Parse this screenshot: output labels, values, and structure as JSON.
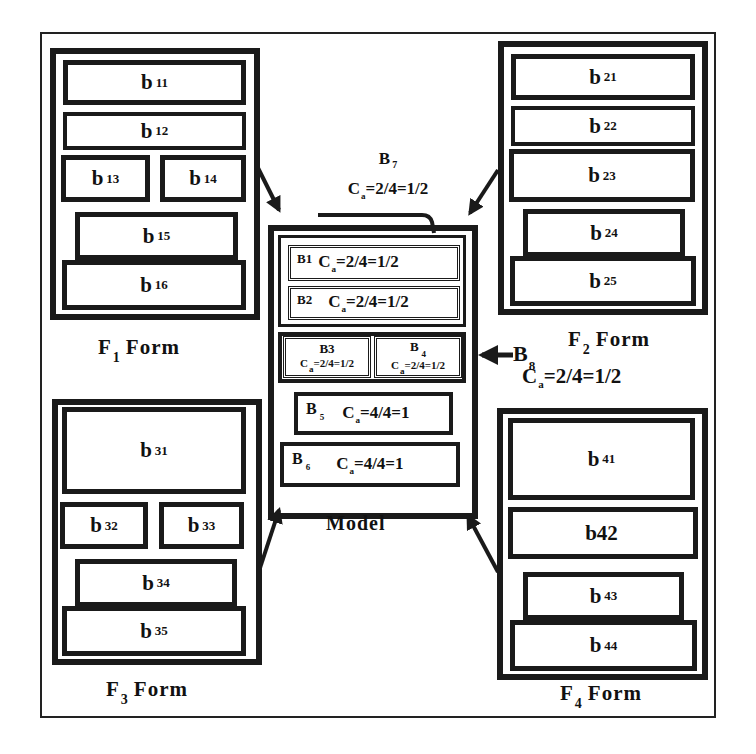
{
  "diagram": {
    "forms": [
      {
        "id": "F1",
        "label_main": "F",
        "label_sub": "1",
        "label_tail": "Form",
        "blocks": [
          {
            "main": "b",
            "sub": "11"
          },
          {
            "main": "b",
            "sub": "12"
          },
          {
            "main": "b",
            "sub": "13"
          },
          {
            "main": "b",
            "sub": "14"
          },
          {
            "main": "b",
            "sub": "15"
          },
          {
            "main": "b",
            "sub": "16"
          }
        ]
      },
      {
        "id": "F2",
        "label_main": "F",
        "label_sub": "2",
        "label_tail": "Form",
        "blocks": [
          {
            "main": "b",
            "sub": "21"
          },
          {
            "main": "b",
            "sub": "22"
          },
          {
            "main": "b",
            "sub": "23"
          },
          {
            "main": "b",
            "sub": "24"
          },
          {
            "main": "b",
            "sub": "25"
          }
        ]
      },
      {
        "id": "F3",
        "label_main": "F",
        "label_sub": "3",
        "label_tail": "Form",
        "blocks": [
          {
            "main": "b",
            "sub": "31"
          },
          {
            "main": "b",
            "sub": "32"
          },
          {
            "main": "b",
            "sub": "33"
          },
          {
            "main": "b",
            "sub": "34"
          },
          {
            "main": "b",
            "sub": "35"
          }
        ]
      },
      {
        "id": "F4",
        "label_main": "F",
        "label_sub": "4",
        "label_tail": "Form",
        "blocks": [
          {
            "main": "b",
            "sub": "41"
          },
          {
            "main": "b42",
            "sub": ""
          },
          {
            "main": "b",
            "sub": "43"
          },
          {
            "main": "b",
            "sub": "44"
          }
        ]
      }
    ],
    "model": {
      "label": "Model",
      "blocks": [
        {
          "tag": "B1",
          "ca_prefix": "C",
          "ca_sub": "a",
          "ca_value": "=2/4=1/2"
        },
        {
          "tag": "B2",
          "ca_prefix": "C",
          "ca_sub": "a",
          "ca_value": "=2/4=1/2"
        },
        {
          "tag": "B3",
          "ca_prefix": "C",
          "ca_sub": "a",
          "ca_value": "=2/4=1/2"
        },
        {
          "tag_main": "B",
          "tag_sub": "4",
          "ca_prefix": "C",
          "ca_sub": "a",
          "ca_value": "=2/4=1/2"
        },
        {
          "tag_main": "B",
          "tag_sub": "5",
          "ca_prefix": "C",
          "ca_sub": "a",
          "ca_value": "=4/4=1"
        },
        {
          "tag_main": "B",
          "tag_sub": "6",
          "ca_prefix": "C",
          "ca_sub": "a",
          "ca_value": "=4/4=1"
        }
      ]
    },
    "callouts": [
      {
        "tag_main": "B",
        "tag_sub": "7",
        "ca_prefix": "C",
        "ca_sub": "a",
        "ca_value": "=2/4=1/2"
      },
      {
        "tag_main": "B",
        "tag_sub": "8",
        "ca_prefix": "C",
        "ca_sub": "a",
        "ca_value": "=2/4=1/2"
      }
    ]
  }
}
